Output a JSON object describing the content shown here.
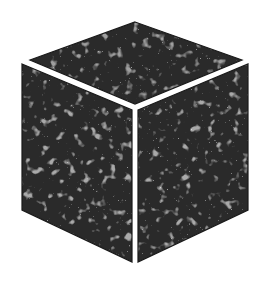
{
  "figure": {
    "description": "Isometric cube rendered with dense dark noisy texture (simulation box)",
    "background_color": "#ffffff",
    "face_base_color": "#2e2e2e",
    "speckle_color": "#9a9a9a",
    "edge_color": "#1a1a1a",
    "gap_color": "#ffffff",
    "faces": [
      {
        "name": "top",
        "points": "135,22 242,60 135,104 30,60"
      },
      {
        "name": "left",
        "points": "22,64 132,110 132,262 22,210"
      },
      {
        "name": "right",
        "points": "138,110 248,64 248,210 138,262"
      }
    ]
  }
}
